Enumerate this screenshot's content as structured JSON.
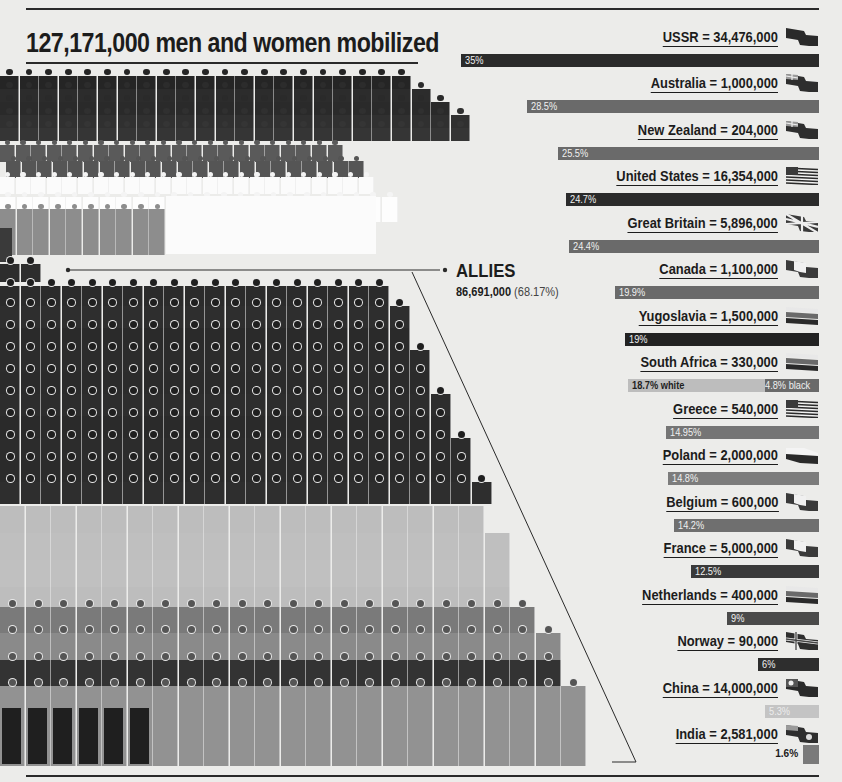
{
  "title": "127,171,000 men and women mobilized",
  "allies": {
    "label": "ALLIES",
    "total": "86,691,000",
    "share": "(68.17%)"
  },
  "colors": {
    "background": "#ececea",
    "dark": "#262626",
    "mid_dark": "#4a4a4a",
    "mid": "#6e6e6e",
    "light": "#b8b8b8",
    "very_light": "#d6d6d6",
    "white": "#f8f8f8"
  },
  "countries": [
    {
      "name": "USSR",
      "label": "USSR = 34,476,000",
      "pct_label": "35%",
      "pct": 35,
      "shade": "#2b2b2b",
      "flag": "solid-dark"
    },
    {
      "name": "Australia",
      "label": "Australia = 1,000,000",
      "pct_label": "28.5%",
      "pct": 28.5,
      "shade": "#6a6a6a",
      "flag": "ensign"
    },
    {
      "name": "New Zealand",
      "label": "New Zealand = 204,000",
      "pct_label": "25.5%",
      "pct": 25.5,
      "shade": "#6a6a6a",
      "flag": "ensign"
    },
    {
      "name": "United States",
      "label": "United States = 16,354,000",
      "pct_label": "24.7%",
      "pct": 24.7,
      "shade": "#2b2b2b",
      "flag": "stripes"
    },
    {
      "name": "Great Britain",
      "label": "Great Britain = 5,896,000",
      "pct_label": "24.4%",
      "pct": 24.4,
      "shade": "#6a6a6a",
      "flag": "union"
    },
    {
      "name": "Canada",
      "label": "Canada = 1,100,000",
      "pct_label": "19.9%",
      "pct": 19.9,
      "shade": "#6a6a6a",
      "flag": "vertical-tricolor"
    },
    {
      "name": "Yugoslavia",
      "label": "Yugoslavia = 1,500,000",
      "pct_label": "19%",
      "pct": 19,
      "shade": "#222222",
      "flag": "horizontal-tricolor"
    },
    {
      "name": "South Africa",
      "label": "South Africa = 330,000",
      "pct_label": "18.7% white",
      "pct": 18.7,
      "pct_label_2": "4.8% black",
      "pct_2": 4.8,
      "shade": "#bdbdbd",
      "shade_2": "#6a6a6a",
      "flag": "horizontal-tricolor"
    },
    {
      "name": "Greece",
      "label": "Greece = 540,000",
      "pct_label": "14.95%",
      "pct": 14.95,
      "shade": "#757575",
      "flag": "stripes"
    },
    {
      "name": "Poland",
      "label": "Poland = 2,000,000",
      "pct_label": "14.8%",
      "pct": 14.8,
      "shade": "#7c7c7c",
      "flag": "bicolor"
    },
    {
      "name": "Belgium",
      "label": "Belgium = 600,000",
      "pct_label": "14.2%",
      "pct": 14.2,
      "shade": "#6f6f6f",
      "flag": "vertical-tricolor"
    },
    {
      "name": "France",
      "label": "France = 5,000,000",
      "pct_label": "12.5%",
      "pct": 12.5,
      "shade": "#3a3a3a",
      "flag": "vertical-tricolor"
    },
    {
      "name": "Netherlands",
      "label": "Netherlands = 400,000",
      "pct_label": "9%",
      "pct": 9,
      "shade": "#4a4a4a",
      "flag": "horizontal-tricolor"
    },
    {
      "name": "Norway",
      "label": "Norway = 90,000",
      "pct_label": "6%",
      "pct": 6,
      "shade": "#2e2e2e",
      "flag": "cross"
    },
    {
      "name": "China",
      "label": "China = 14,000,000",
      "pct_label": "5.3%",
      "pct": 5.3,
      "shade": "#c4c4c4",
      "flag": "canton-sun"
    },
    {
      "name": "India",
      "label": "India = 2,581,000",
      "pct_label": "1.6%",
      "pct": 1.6,
      "shade": "#7a7a7a",
      "flag": "ensign-star",
      "label_outside": true
    }
  ],
  "chart_data": {
    "type": "bar",
    "orientation": "horizontal",
    "title": "127,171,000 men and women mobilized",
    "subtitle": "ALLIES 86,691,000 (68.17%)",
    "xlabel": "",
    "ylabel": "",
    "unit": "% of population mobilized",
    "categories": [
      "USSR",
      "Australia",
      "New Zealand",
      "United States",
      "Great Britain",
      "Canada",
      "Yugoslavia",
      "South Africa",
      "Greece",
      "Poland",
      "Belgium",
      "France",
      "Netherlands",
      "Norway",
      "China",
      "India"
    ],
    "mobilized": [
      34476000,
      1000000,
      204000,
      16354000,
      5896000,
      1100000,
      1500000,
      330000,
      540000,
      2000000,
      600000,
      5000000,
      400000,
      90000,
      14000000,
      2581000
    ],
    "values": [
      35,
      28.5,
      25.5,
      24.7,
      24.4,
      19.9,
      19,
      18.7,
      14.95,
      14.8,
      14.2,
      12.5,
      9,
      6,
      5.3,
      1.6
    ],
    "series": [
      {
        "name": "% mobilized",
        "values": [
          35,
          28.5,
          25.5,
          24.7,
          24.4,
          19.9,
          19,
          18.7,
          14.95,
          14.8,
          14.2,
          12.5,
          9,
          6,
          5.3,
          1.6
        ]
      },
      {
        "name": "South Africa (black)",
        "values": [
          null,
          null,
          null,
          null,
          null,
          null,
          null,
          4.8,
          null,
          null,
          null,
          null,
          null,
          null,
          null,
          null
        ]
      }
    ],
    "annotations": [
      "18.7% white",
      "4.8% black"
    ],
    "bars_right_aligned": true,
    "grid": false,
    "legend": "none",
    "xlim": [
      0,
      35
    ]
  }
}
